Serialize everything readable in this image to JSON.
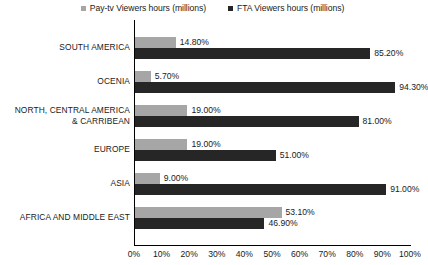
{
  "chart_data": {
    "type": "bar",
    "orientation": "horizontal",
    "title": "",
    "xlabel": "",
    "ylabel": "",
    "xlim": [
      0,
      100
    ],
    "grid": false,
    "legend_position": "top-center",
    "categories": [
      "SOUTH AMERICA",
      "OCENIA",
      "NORTH, CENTRAL AMERICA & CARRIBEAN",
      "EUROPE",
      "ASIA",
      "AFRICA AND MIDDLE EAST"
    ],
    "category_lines": [
      [
        "SOUTH AMERICA"
      ],
      [
        "OCENIA"
      ],
      [
        "NORTH, CENTRAL AMERICA",
        "& CARRIBEAN"
      ],
      [
        "EUROPE"
      ],
      [
        "ASIA"
      ],
      [
        "AFRICA AND MIDDLE EAST"
      ]
    ],
    "series": [
      {
        "name": "Pay-tv Viewers hours (millions)",
        "color": "#a6a6a6",
        "values": [
          14.8,
          5.7,
          19.0,
          19.0,
          9.0,
          53.1
        ],
        "labels": [
          "14.80%",
          "5.70%",
          "19.00%",
          "19.00%",
          "9.00%",
          "53.10%"
        ]
      },
      {
        "name": "FTA Viewers hours (millions)",
        "color": "#262626",
        "values": [
          85.2,
          94.3,
          81.0,
          51.0,
          91.0,
          46.9
        ],
        "labels": [
          "85.20%",
          "94.30%",
          "81.00%",
          "51.00%",
          "91.00%",
          "46.90%"
        ]
      }
    ],
    "xticks": [
      0,
      10,
      20,
      30,
      40,
      50,
      60,
      70,
      80,
      90,
      100
    ],
    "xtick_labels": [
      "0%",
      "10%",
      "20%",
      "30%",
      "40%",
      "50%",
      "60%",
      "70%",
      "80%",
      "90%",
      "100%"
    ]
  },
  "legend": {
    "entries": [
      {
        "label": "Pay-tv Viewers hours (millions)",
        "color": "#a6a6a6"
      },
      {
        "label": "FTA Viewers hours (millions)",
        "color": "#262626"
      }
    ]
  },
  "colors": {
    "pay_tv": "#a6a6a6",
    "fta": "#262626",
    "axis": "#000000",
    "text": "#1a1a1a",
    "background": "#ffffff"
  }
}
